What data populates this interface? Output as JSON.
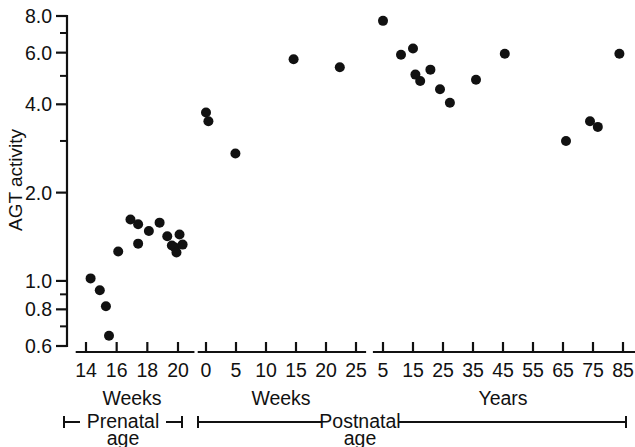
{
  "chart_data": {
    "type": "scatter",
    "title": "",
    "subtitle": "",
    "ylabel": "AGT activity",
    "xlabel": "",
    "yscale": "log",
    "ylim": [
      0.6,
      8.0
    ],
    "ytick_labels": [
      "8.0",
      "6.0",
      "4.0",
      "2.0",
      "1.0",
      "0.8",
      "0.6"
    ],
    "ytick_values": [
      8.0,
      6.0,
      4.0,
      2.0,
      1.0,
      0.8,
      0.6
    ],
    "yminor_values": [
      7.0,
      5.0,
      3.0,
      0.9,
      0.7
    ],
    "grid": false,
    "legend": null,
    "panels": [
      {
        "id": "prenatal-weeks",
        "unit_label": "Weeks",
        "group_label": "Prenatal",
        "group_sublabel": "age",
        "xlim": [
          13.4,
          21.0
        ],
        "xtick_labels": [
          "14",
          "16",
          "18",
          "20"
        ],
        "xtick_values": [
          14,
          16,
          18,
          20
        ],
        "x": [
          14.3,
          14.9,
          15.5,
          15.3,
          16.1,
          16.9,
          17.4,
          17.4,
          18.1,
          18.8,
          19.3,
          19.6,
          19.8,
          19.9,
          20.1,
          20.3
        ],
        "y": [
          1.02,
          0.93,
          0.65,
          0.82,
          1.26,
          1.62,
          1.56,
          1.34,
          1.48,
          1.58,
          1.42,
          1.32,
          1.3,
          1.25,
          1.44,
          1.33
        ]
      },
      {
        "id": "postnatal-weeks",
        "unit_label": "Weeks",
        "group_label": "Postnatal",
        "group_sublabel": "age",
        "xlim": [
          -1.2,
          26.5
        ],
        "xtick_labels": [
          "0",
          "5",
          "10",
          "15",
          "20",
          "25"
        ],
        "xtick_values": [
          0,
          5,
          10,
          15,
          20,
          25
        ],
        "x": [
          0.0,
          0.4,
          4.9,
          14.6,
          22.3
        ],
        "y": [
          3.75,
          3.5,
          2.72,
          5.7,
          5.35
        ]
      },
      {
        "id": "postnatal-years",
        "unit_label": "Years",
        "group_label": "Postnatal",
        "group_sublabel": "age",
        "xlim": [
          2.0,
          89.0
        ],
        "xtick_labels": [
          "5",
          "15",
          "25",
          "35",
          "45",
          "55",
          "65",
          "75",
          "85"
        ],
        "xtick_values": [
          5,
          15,
          25,
          35,
          45,
          55,
          65,
          75,
          85
        ],
        "x": [
          5.0,
          11.0,
          15.0,
          15.8,
          17.4,
          20.8,
          24.0,
          27.3,
          36.0,
          45.6,
          66.0,
          74.0,
          76.6,
          83.8
        ],
        "y": [
          7.7,
          5.9,
          6.2,
          5.05,
          4.8,
          5.25,
          4.5,
          4.05,
          4.85,
          5.95,
          3.0,
          3.5,
          3.35,
          5.95
        ]
      }
    ]
  },
  "axis": {
    "y_title": "AGT activity"
  },
  "marker": {
    "color": "#111111",
    "radius_px": 5.0,
    "shape": "circle"
  }
}
